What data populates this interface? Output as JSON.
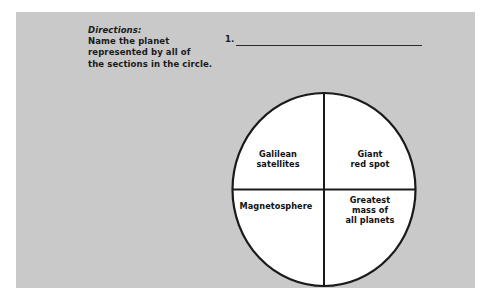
{
  "panel": {
    "background_color": "#c9c9c9"
  },
  "directions": {
    "title": "Directions:",
    "lines": [
      "Name the planet",
      "represented by all of",
      "the sections in the circle."
    ]
  },
  "answer": {
    "number": "1.",
    "value": "",
    "placeholder": ""
  },
  "diagram": {
    "type": "quartered-circle",
    "stroke_color": "#1a1a1a",
    "fill_color": "#ffffff",
    "quadrants": [
      {
        "position": "top-left",
        "lines": [
          "Galilean",
          "satellites"
        ]
      },
      {
        "position": "top-right",
        "lines": [
          "Giant",
          "red spot"
        ]
      },
      {
        "position": "bottom-left",
        "lines": [
          "Magnetosphere"
        ]
      },
      {
        "position": "bottom-right",
        "lines": [
          "Greatest",
          "mass of",
          "all planets"
        ]
      }
    ]
  }
}
